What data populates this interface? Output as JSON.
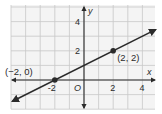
{
  "chart_data": {
    "type": "line",
    "title": "",
    "xlabel": "x",
    "ylabel": "y",
    "xlim": [
      -5,
      5
    ],
    "ylim": [
      -2,
      5
    ],
    "grid": true,
    "x_ticks": [
      {
        "value": -2,
        "label": "-2"
      },
      {
        "value": 2,
        "label": "2"
      },
      {
        "value": 4,
        "label": "4"
      }
    ],
    "y_ticks": [
      {
        "value": 2,
        "label": "2"
      },
      {
        "value": 4,
        "label": "4"
      }
    ],
    "origin_label": "O",
    "series": [
      {
        "name": "line",
        "equation": "y = 0.5x + 1",
        "slope": 0.5,
        "intercept": 1,
        "x": [
          -4.9,
          4.9
        ],
        "y": [
          -1.45,
          3.45
        ],
        "arrows_both_ends": true
      }
    ],
    "points": [
      {
        "x": -2,
        "y": 0,
        "label": "(−2, 0)"
      },
      {
        "x": 2,
        "y": 2,
        "label": "(2, 2)"
      }
    ],
    "colors": {
      "grid": "#c8c8c8",
      "axis": "#2b2b2b",
      "line": "#2b2b2b",
      "background": "#f4f4f4"
    }
  }
}
